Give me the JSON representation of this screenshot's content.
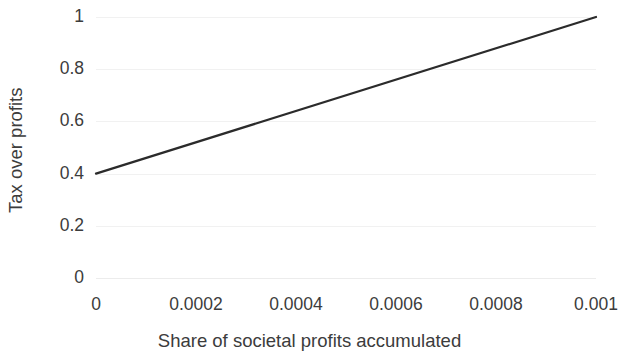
{
  "chart_data": {
    "type": "line",
    "title": "",
    "xlabel": "Share of societal profits accumulated",
    "ylabel": "Tax over profits",
    "xlim": [
      0,
      0.001
    ],
    "ylim": [
      0,
      1
    ],
    "grid": "horizontal",
    "legend": "none",
    "x_ticks": [
      {
        "value": 0,
        "label": "0"
      },
      {
        "value": 0.0002,
        "label": "0.0002"
      },
      {
        "value": 0.0004,
        "label": "0.0004"
      },
      {
        "value": 0.0006,
        "label": "0.0006"
      },
      {
        "value": 0.0008,
        "label": "0.0008"
      },
      {
        "value": 0.001,
        "label": "0.001"
      }
    ],
    "y_ticks": [
      {
        "value": 0,
        "label": "0"
      },
      {
        "value": 0.2,
        "label": "0.2"
      },
      {
        "value": 0.4,
        "label": "0.4"
      },
      {
        "value": 0.6,
        "label": "0.6"
      },
      {
        "value": 0.8,
        "label": "0.8"
      },
      {
        "value": 1,
        "label": "1"
      }
    ],
    "series": [
      {
        "name": "tax-over-profits",
        "color": "#2b2b2b",
        "line_width": 2.2,
        "x": [
          0,
          0.001
        ],
        "values": [
          0.4,
          1.0
        ]
      }
    ]
  },
  "style": {
    "background": "#ffffff",
    "text_color": "#3c3c3c",
    "grid_color": "#f1f1f1",
    "line_color": "#2b2b2b"
  }
}
